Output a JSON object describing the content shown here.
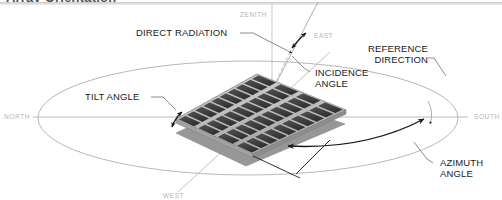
{
  "figure": {
    "title": "Array Orientation",
    "type": "technical-illustration"
  },
  "labels": {
    "direct_radiation": "DIRECT RADIATION",
    "tilt_angle": "TILT ANGLE",
    "incidence_angle_line1": "INCIDENCE",
    "incidence_angle_line2": "ANGLE",
    "reference_direction_line1": "REFERENCE",
    "reference_direction_line2": "DIRECTION",
    "azimuth_angle_line1": "AZIMUTH",
    "azimuth_angle_line2": "ANGLE",
    "zenith": "ZENITH"
  },
  "compass": {
    "north": "NORTH",
    "south": "SOUTH",
    "east": "EAST",
    "west": "WEST"
  },
  "colors": {
    "label_text": "#1a1a1a",
    "compass_text": "#b3b3b3",
    "horizon_line": "#9a9a9a",
    "leader_line": "#6e6e6e",
    "arrow_dark": "#1a1a1a",
    "panel_frame": "#b9b9b9",
    "panel_cell": "#3d3d3d",
    "panel_shadow": "#8c8c8c",
    "title_text": "#555555",
    "background": "#ffffff"
  },
  "geometry": {
    "horizon_ellipse_cx": 248,
    "horizon_ellipse_cy": 118,
    "horizon_ellipse_rx": 210,
    "horizon_ellipse_ry": 57,
    "panel_cell_rows": 4,
    "panel_cell_cols": 10,
    "zenith_axis_x": 272
  }
}
